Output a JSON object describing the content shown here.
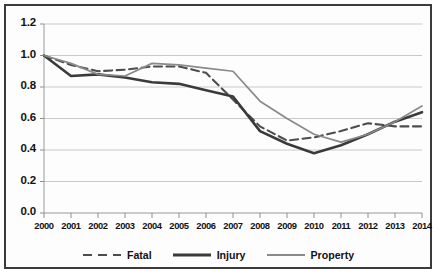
{
  "chart_data": {
    "type": "line",
    "title": "",
    "xlabel": "",
    "ylabel": "",
    "ylim": [
      0.0,
      1.2
    ],
    "ytick_labels": [
      "0.0",
      "0.2",
      "0.4",
      "0.6",
      "0.8",
      "1.0",
      "1.2"
    ],
    "ytick_values": [
      0.0,
      0.2,
      0.4,
      0.6,
      0.8,
      1.0,
      1.2
    ],
    "grid": true,
    "legend_position": "bottom",
    "categories": [
      "2000",
      "2001",
      "2002",
      "2003",
      "2004",
      "2005",
      "2006",
      "2007",
      "2008",
      "2009",
      "2010",
      "2011",
      "2012",
      "2013",
      "2014"
    ],
    "x": [
      2000,
      2001,
      2002,
      2003,
      2004,
      2005,
      2006,
      2007,
      2008,
      2009,
      2010,
      2011,
      2012,
      2013,
      2014
    ],
    "series": [
      {
        "name": "Fatal",
        "style": "dashed",
        "color": "#4d4d4d",
        "values": [
          1.0,
          0.94,
          0.9,
          0.91,
          0.93,
          0.93,
          0.89,
          0.72,
          0.55,
          0.46,
          0.48,
          0.52,
          0.57,
          0.55,
          0.55
        ]
      },
      {
        "name": "Injury",
        "style": "solid-thick",
        "color": "#3a3a3a",
        "values": [
          1.0,
          0.87,
          0.88,
          0.86,
          0.83,
          0.82,
          0.78,
          0.74,
          0.52,
          0.44,
          0.38,
          0.43,
          0.5,
          0.58,
          0.64
        ]
      },
      {
        "name": "Property",
        "style": "solid-thin",
        "color": "#8a8a8a",
        "values": [
          1.0,
          0.95,
          0.88,
          0.87,
          0.95,
          0.94,
          0.92,
          0.9,
          0.71,
          0.6,
          0.5,
          0.45,
          0.5,
          0.58,
          0.68
        ]
      }
    ]
  },
  "legend": {
    "items": [
      {
        "label": "Fatal"
      },
      {
        "label": "Injury"
      },
      {
        "label": "Property"
      }
    ]
  }
}
